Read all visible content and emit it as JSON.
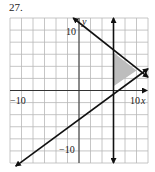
{
  "problem": {
    "number": "27."
  },
  "chart_data": {
    "type": "line",
    "title": "",
    "xlabel": "x",
    "ylabel": "y",
    "xlim": [
      -12,
      12
    ],
    "ylim": [
      -12,
      12
    ],
    "grid": true,
    "grid_step": 2,
    "tick_labels": {
      "x_min": "−10",
      "x_max": "10",
      "y_max": "10",
      "y_min": "−10"
    },
    "series": [
      {
        "name": "vertical-boundary",
        "equation": "x = 6",
        "points": [
          [
            6,
            -12
          ],
          [
            6,
            12
          ]
        ]
      },
      {
        "name": "decreasing-boundary",
        "equation": "3x + 4y = 43 (approx)",
        "points": [
          [
            -1,
            12
          ],
          [
            12,
            2.2
          ]
        ]
      },
      {
        "name": "increasing-boundary",
        "equation": "2x - 3y = 10",
        "points": [
          [
            -11,
            -12.5
          ],
          [
            12,
            3.6
          ]
        ]
      }
    ],
    "shaded_region": {
      "description": "feasible triangle",
      "vertices": [
        [
          6,
          6.3
        ],
        [
          10,
          3.3
        ],
        [
          6,
          0.7
        ]
      ],
      "fill": "#bdbdbd"
    },
    "colors": {
      "line": "#111111",
      "grid": "#b8b8b8",
      "shade": "#bdbdbd"
    }
  }
}
